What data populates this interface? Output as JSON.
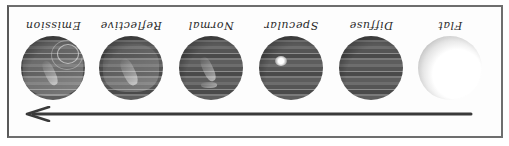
{
  "figure": {
    "orientation": "rotated-180",
    "direction_arrow": "arrow-right-to-left (in screen space), i.e. progression from Flat to Emission",
    "stages": [
      {
        "label": "Flat",
        "style": "flat"
      },
      {
        "label": "Diffuse",
        "style": "banded"
      },
      {
        "label": "Specular",
        "style": "banded-specular-highlight"
      },
      {
        "label": "Normal",
        "style": "banded-normal-map"
      },
      {
        "label": "Reflective",
        "style": "banded-reflective"
      },
      {
        "label": "Emission",
        "style": "banded-emission"
      }
    ]
  },
  "colors": {
    "border": "#6e6e6e",
    "arrow": "#3a3a3a",
    "text": "#2a2a2a"
  }
}
